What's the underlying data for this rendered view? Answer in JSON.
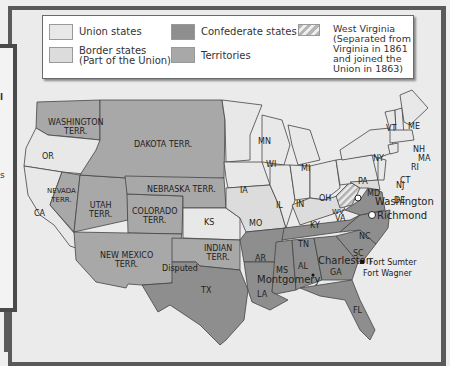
{
  "legend": {
    "items": [
      {
        "key": "union",
        "label": "Union states",
        "color": "#e8e8e8"
      },
      {
        "key": "border",
        "label": "Border states\n(Part of the Union)",
        "color": "#dcdcdc"
      },
      {
        "key": "confederate",
        "label": "Confederate states",
        "color": "#8e8e8e"
      },
      {
        "key": "territories",
        "label": "Territories",
        "color": "#a8a8a8"
      },
      {
        "key": "west_virginia",
        "label": "West Virginia\n(Separated from\nVirginia in 1861\nand joined the\nUnion in 1863)",
        "color": "striped"
      }
    ]
  },
  "side_panel": {
    "glyphs": [
      "l",
      "s"
    ]
  },
  "map": {
    "states": {
      "WA": "WASHINGTON\nTERR.",
      "OR": "OR",
      "CA": "CA",
      "NV": "NEVADA\nTERR.",
      "UT": "UTAH\nTERR.",
      "CO": "COLORADO\nTERR.",
      "DK": "DAKOTA TERR.",
      "NE": "NEBRASKA TERR.",
      "KS": "KS",
      "NM": "NEW MEXICO\nTERR.",
      "IT": "INDIAN\nTERR.",
      "TX": "TX",
      "MN": "MN",
      "IA": "IA",
      "MO": "MO",
      "AR": "AR",
      "LA": "LA",
      "WI": "WI",
      "IL": "IL",
      "MI": "MI",
      "IN": "IN",
      "OH": "OH",
      "KY": "KY",
      "TN": "TN",
      "MS": "MS",
      "AL": "AL",
      "GA": "GA",
      "FL": "FL",
      "SC": "SC",
      "NC": "NC",
      "VA": "VA",
      "WV": "WV",
      "PA": "PA",
      "NY": "NY",
      "VT": "VT",
      "ME": "ME",
      "NH": "NH",
      "MA": "MA",
      "RI": "RI",
      "CT": "CT",
      "NJ": "NJ",
      "DE": "DE",
      "MD": "MD"
    },
    "places": {
      "disputed": "Disputed",
      "washington": "Washington",
      "richmond": "Richmond",
      "charleston": "Charleston",
      "fort_sumter": "Fort Sumter",
      "fort_wagner": "Fort Wagner",
      "montgomery": "Montgomery"
    }
  }
}
